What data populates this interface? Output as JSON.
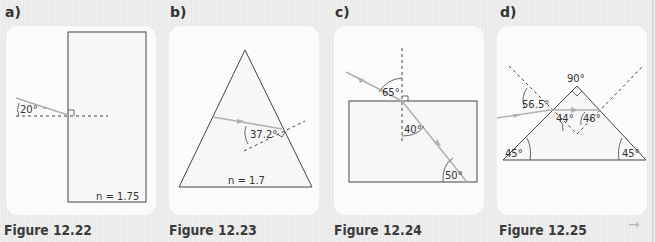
{
  "panels": [
    {
      "letter": "a)",
      "caption": "Figure 12.22",
      "angle_labels": [
        "20°"
      ],
      "index_label": "n = 1.75"
    },
    {
      "letter": "b)",
      "caption": "Figure 12.23",
      "angle_labels": [
        "37.2°"
      ],
      "index_label": "n = 1.7"
    },
    {
      "letter": "c)",
      "caption": "Figure 12.24",
      "angle_labels": [
        "65°",
        "40°",
        "50°"
      ]
    },
    {
      "letter": "d)",
      "caption": "Figure 12.25",
      "angle_labels": [
        "90°",
        "56.5°",
        "44°",
        "46°",
        "45°",
        "45°"
      ]
    }
  ],
  "navigation": {
    "next_icon": "→"
  },
  "colors": {
    "ray": "#b0b0b0",
    "outline": "#444444",
    "card": "#fbfbfb",
    "background": "#ededed"
  }
}
